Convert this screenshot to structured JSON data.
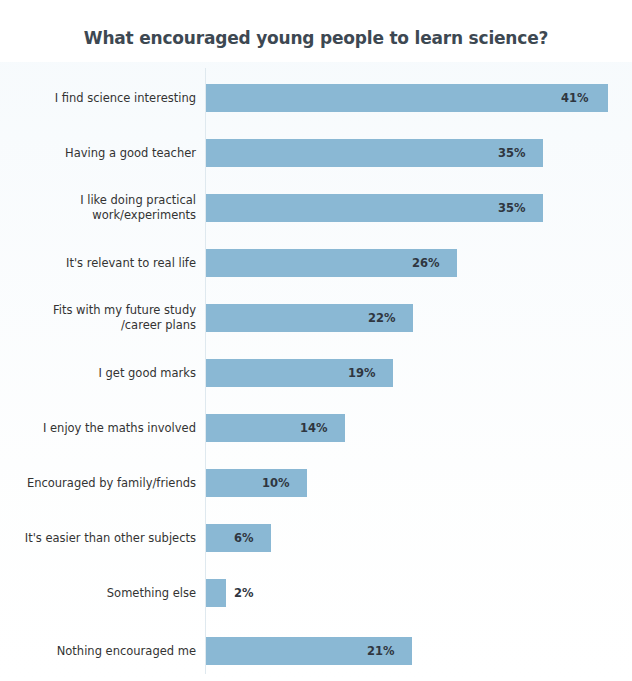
{
  "chart_data": {
    "type": "bar",
    "orientation": "horizontal",
    "title": "What encouraged young people to learn science?",
    "xlabel": "",
    "ylabel": "",
    "unit": "%",
    "grid": false,
    "legend": null,
    "categories": [
      "I find science interesting",
      "Having a good teacher",
      "I like doing practical work/experiments",
      "It's relevant to real life",
      "Fits with my future study/career plans",
      "I get good marks",
      "I enjoy the maths involved",
      "Encouraged by family/friends",
      "It's easier than other subjects",
      "Something else",
      "Nothing encouraged me"
    ],
    "values": [
      41,
      35,
      35,
      26,
      22,
      19,
      14,
      10,
      6,
      2,
      21
    ],
    "value_labels": [
      "41%",
      "35%",
      "35%",
      "26%",
      "22%",
      "19%",
      "14%",
      "10%",
      "6%",
      "2%",
      "21%"
    ],
    "bars": [
      {
        "label_lines": [
          "I find science interesting"
        ],
        "value": 41,
        "value_label": "41%",
        "bar_px": 402,
        "label_px": 355,
        "label_inside": true
      },
      {
        "label_lines": [
          "Having a good teacher"
        ],
        "value": 35,
        "value_label": "35%",
        "bar_px": 337,
        "label_px": 292,
        "label_inside": true
      },
      {
        "label_lines": [
          "I like doing practical",
          "work/experiments"
        ],
        "value": 35,
        "value_label": "35%",
        "bar_px": 337,
        "label_px": 292,
        "label_inside": true
      },
      {
        "label_lines": [
          "It's relevant to real life"
        ],
        "value": 26,
        "value_label": "26%",
        "bar_px": 251,
        "label_px": 206,
        "label_inside": true
      },
      {
        "label_lines": [
          "Fits with my future study",
          "/career plans"
        ],
        "value": 22,
        "value_label": "22%",
        "bar_px": 207,
        "label_px": 162,
        "label_inside": true
      },
      {
        "label_lines": [
          "I get good marks"
        ],
        "value": 19,
        "value_label": "19%",
        "bar_px": 187,
        "label_px": 142,
        "label_inside": true
      },
      {
        "label_lines": [
          "I enjoy the maths involved"
        ],
        "value": 14,
        "value_label": "14%",
        "bar_px": 139,
        "label_px": 94,
        "label_inside": true
      },
      {
        "label_lines": [
          "Encouraged by family/friends"
        ],
        "value": 10,
        "value_label": "10%",
        "bar_px": 101,
        "label_px": 56,
        "label_inside": true
      },
      {
        "label_lines": [
          "It's easier than other subjects"
        ],
        "value": 6,
        "value_label": "6%",
        "bar_px": 65,
        "label_px": 28,
        "label_inside": true
      },
      {
        "label_lines": [
          "Something else"
        ],
        "value": 2,
        "value_label": "2%",
        "bar_px": 20,
        "label_px": 28,
        "label_inside": false
      },
      {
        "label_lines": [
          "Nothing encouraged me"
        ],
        "value": 21,
        "value_label": "21%",
        "bar_px": 206,
        "label_px": 161,
        "label_inside": true
      }
    ],
    "row_tops": [
      22,
      77,
      132,
      187,
      242,
      297,
      352,
      407,
      462,
      517,
      575
    ],
    "colors": {
      "bar_fill": "#8ab8d4",
      "title_text": "#3d4852",
      "category_text": "#333333",
      "value_text": "#2f3640",
      "background": "#ffffff",
      "axis_line": "#dfe9ef"
    }
  }
}
